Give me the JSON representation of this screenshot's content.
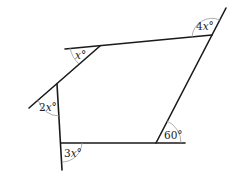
{
  "diagram": {
    "type": "geometry-exterior-angles",
    "angles": [
      {
        "id": "top-right",
        "label_coef": "4",
        "label_var": "x",
        "label_unit": "°"
      },
      {
        "id": "top-left",
        "label_coef": "",
        "label_var": "x",
        "label_unit": "°"
      },
      {
        "id": "left",
        "label_coef": "2",
        "label_var": "x",
        "label_unit": "°"
      },
      {
        "id": "bottom-left",
        "label_coef": "3",
        "label_var": "x",
        "label_unit": "°"
      },
      {
        "id": "bottom-right",
        "label_value": "60°"
      }
    ],
    "colors": {
      "line": "#1a1a1a",
      "arc": "#9a9a9a",
      "text": "#222222"
    }
  }
}
